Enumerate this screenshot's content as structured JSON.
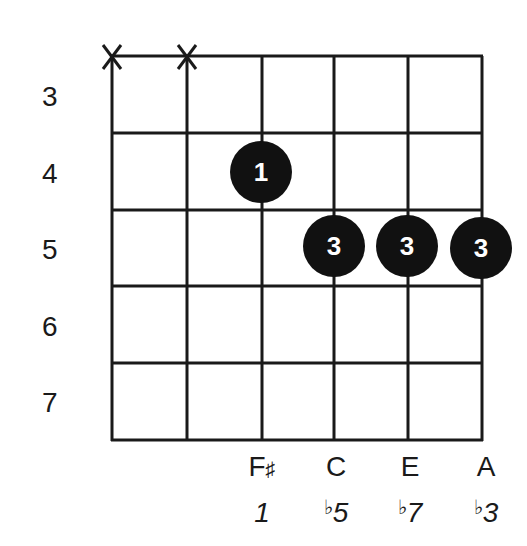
{
  "chord_diagram": {
    "colors": {
      "line": "#1a1a1a",
      "dot": "#111111",
      "dot_text": "#ffffff",
      "background": "#ffffff"
    },
    "grid": {
      "string_x": [
        112,
        187,
        262,
        334,
        408,
        482
      ],
      "fret_y": [
        56,
        133,
        210,
        286,
        363,
        440
      ]
    },
    "fret_numbers": [
      "3",
      "4",
      "5",
      "6",
      "7"
    ],
    "muted_strings": [
      {
        "string": 1,
        "symbol": "X"
      },
      {
        "string": 2,
        "symbol": "X"
      }
    ],
    "fingers": [
      {
        "string": 3,
        "fret": "4",
        "finger": "1"
      },
      {
        "string": 4,
        "fret": "5",
        "finger": "3"
      },
      {
        "string": 5,
        "fret": "5",
        "finger": "3"
      },
      {
        "string": 6,
        "fret": "5",
        "finger": "3"
      }
    ],
    "notes": [
      {
        "string": 3,
        "name_letter": "F",
        "name_accidental": "♯",
        "interval_accidental": "",
        "interval_degree": "1"
      },
      {
        "string": 4,
        "name_letter": "C",
        "name_accidental": "",
        "interval_accidental": "♭",
        "interval_degree": "5"
      },
      {
        "string": 5,
        "name_letter": "E",
        "name_accidental": "",
        "interval_accidental": "♭",
        "interval_degree": "7"
      },
      {
        "string": 6,
        "name_letter": "A",
        "name_accidental": "",
        "interval_accidental": "♭",
        "interval_degree": "3"
      }
    ]
  }
}
